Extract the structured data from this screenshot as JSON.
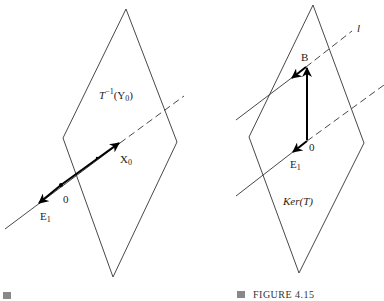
{
  "left_figure": {
    "plane_label": {
      "T": "T",
      "sup": "−1",
      "arg": "(Y",
      "arg_sub": "0",
      "close": ")"
    },
    "point_X0": {
      "main": "X",
      "sub": "0"
    },
    "point_0": "0",
    "point_E1": {
      "main": "E",
      "sub": "1"
    },
    "caption": ""
  },
  "right_figure": {
    "line_label": "l",
    "point_B": "B",
    "point_0": "0",
    "point_E1": {
      "main": "E",
      "sub": "1"
    },
    "plane_label": "Ker(T)",
    "caption": "FIGURE 4.15"
  },
  "colors": {
    "line": "#333333",
    "bold": "#000000",
    "caption_square": "#888888"
  }
}
